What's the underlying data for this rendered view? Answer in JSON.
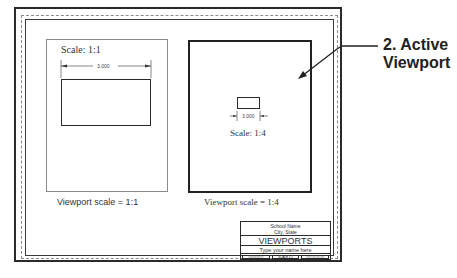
{
  "callout": {
    "line1": "2. Active",
    "line2": "Viewport"
  },
  "left_viewport": {
    "scale_label": "Scale: 1:1",
    "dimension": "3.000",
    "caption": "Viewport scale = 1:1"
  },
  "right_viewport": {
    "scale_label": "Scale: 1:4",
    "dimension": "3.000",
    "caption": "Viewport scale = 1:4"
  },
  "title_block": {
    "school": "School Name",
    "city": "City, State",
    "title": "VIEWPORTS",
    "name_prompt": "Type your name here",
    "cells": [
      "##/##/####",
      "SCALE 1:1",
      "###.##.##.##"
    ]
  },
  "colors": {
    "line": "#2a2a2a",
    "dashed": "#8a8a8a",
    "text": "#333333"
  }
}
